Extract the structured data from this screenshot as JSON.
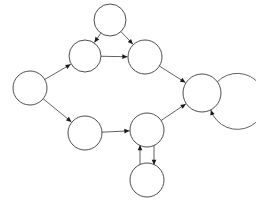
{
  "diagram": {
    "type": "directed-graph",
    "canvas": {
      "width": 256,
      "height": 203,
      "background": "#ffffff"
    },
    "style": {
      "node_stroke": "#3a3a3a",
      "node_fill": "none",
      "edge_stroke": "#3a3a3a",
      "arrow_fill": "#1a1a1a",
      "node_stroke_width": 0.9,
      "edge_stroke_width": 0.8
    },
    "nodes": [
      {
        "id": "n0",
        "label": "",
        "cx": 30,
        "cy": 88,
        "r": 17
      },
      {
        "id": "n1",
        "label": "",
        "cx": 85,
        "cy": 56,
        "r": 16
      },
      {
        "id": "n2",
        "label": "",
        "cx": 110,
        "cy": 20,
        "r": 16
      },
      {
        "id": "n3",
        "label": "",
        "cx": 145,
        "cy": 57,
        "r": 17
      },
      {
        "id": "n4",
        "label": "",
        "cx": 202,
        "cy": 93,
        "r": 19
      },
      {
        "id": "n5",
        "label": "",
        "cx": 85,
        "cy": 133,
        "r": 17
      },
      {
        "id": "n6",
        "label": "",
        "cx": 147,
        "cy": 130,
        "r": 17
      },
      {
        "id": "n7",
        "label": "",
        "cx": 147,
        "cy": 180,
        "r": 17
      }
    ],
    "edges": [
      {
        "id": "e0",
        "from": "n0",
        "to": "n1",
        "label": "",
        "kind": "straight"
      },
      {
        "id": "e1",
        "from": "n0",
        "to": "n5",
        "label": "",
        "kind": "straight"
      },
      {
        "id": "e2",
        "from": "n2",
        "to": "n1",
        "label": "",
        "kind": "straight"
      },
      {
        "id": "e3",
        "from": "n2",
        "to": "n3",
        "label": "",
        "kind": "straight"
      },
      {
        "id": "e4",
        "from": "n1",
        "to": "n3",
        "label": "",
        "kind": "straight"
      },
      {
        "id": "e5",
        "from": "n3",
        "to": "n4",
        "label": "",
        "kind": "straight"
      },
      {
        "id": "e6",
        "from": "n5",
        "to": "n6",
        "label": "",
        "kind": "straight"
      },
      {
        "id": "e7",
        "from": "n6",
        "to": "n4",
        "label": "",
        "kind": "straight"
      },
      {
        "id": "e8",
        "from": "n7",
        "to": "n6",
        "label": "",
        "kind": "parallel-left"
      },
      {
        "id": "e9",
        "from": "n6",
        "to": "n7",
        "label": "",
        "kind": "parallel-right"
      },
      {
        "id": "e10",
        "from": "n4",
        "to": "n4",
        "label": "",
        "kind": "self-loop"
      }
    ],
    "counts": {
      "nodes": 8,
      "edges": 11,
      "self_loops": 1,
      "bidirectional_pairs": 1
    }
  }
}
